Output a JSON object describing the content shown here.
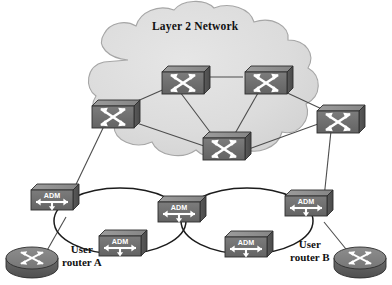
{
  "figure": {
    "title": "Layer 2 Network",
    "background_color": "#ffffff",
    "style": "grayscale-network-diagram"
  },
  "colors": {
    "cloud_fill": "#d9d9d9",
    "cloud_edge": "#9a9a9a",
    "device_top": "#8f8f8f",
    "device_face": "#6e6e6e",
    "device_side": "#555555",
    "device_edge": "#2e2e2e",
    "arrow_white": "#ffffff",
    "link": "#4a4a4a",
    "ring": "#1f1f1f",
    "text": "#111111"
  },
  "cloud": {
    "label": "Layer 2 Network",
    "label_x": 157,
    "label_y": 27
  },
  "switches": [
    {
      "id": "sw-top-left",
      "name": "layer2-switch-top-left",
      "x": 160,
      "y": 68,
      "w": 48,
      "h": 27
    },
    {
      "id": "sw-top-right",
      "name": "layer2-switch-top-right",
      "x": 243,
      "y": 68,
      "w": 48,
      "h": 27
    },
    {
      "id": "sw-left",
      "name": "layer2-switch-left",
      "x": 90,
      "y": 101,
      "w": 48,
      "h": 27
    },
    {
      "id": "sw-right",
      "name": "layer2-switch-right",
      "x": 315,
      "y": 106,
      "w": 48,
      "h": 27
    },
    {
      "id": "sw-bottom",
      "name": "layer2-switch-bottom-center",
      "x": 201,
      "y": 134,
      "w": 48,
      "h": 27
    }
  ],
  "switch_links": [
    {
      "from": "sw-top-left",
      "to": "sw-top-right"
    },
    {
      "from": "sw-left",
      "to": "sw-top-left"
    },
    {
      "from": "sw-left",
      "to": "sw-bottom"
    },
    {
      "from": "sw-top-left",
      "to": "sw-bottom"
    },
    {
      "from": "sw-top-right",
      "to": "sw-bottom"
    },
    {
      "from": "sw-top-right",
      "to": "sw-right"
    },
    {
      "from": "sw-bottom",
      "to": "sw-right"
    }
  ],
  "adms": [
    {
      "id": "adm-left",
      "label": "ADM",
      "name": "adm-node-left",
      "x": 55,
      "y": 195,
      "w": 45,
      "h": 24
    },
    {
      "id": "adm-center",
      "label": "ADM",
      "name": "adm-node-center",
      "x": 181,
      "y": 206,
      "w": 45,
      "h": 24
    },
    {
      "id": "adm-right",
      "label": "ADM",
      "name": "adm-node-right",
      "x": 305,
      "y": 200,
      "w": 45,
      "h": 24
    },
    {
      "id": "adm-lower-left",
      "label": "ADM",
      "name": "adm-node-lower-left",
      "x": 118,
      "y": 240,
      "w": 45,
      "h": 24
    },
    {
      "id": "adm-lower-right",
      "label": "ADM",
      "name": "adm-node-lower-right",
      "x": 245,
      "y": 241,
      "w": 45,
      "h": 24
    }
  ],
  "rings": [
    {
      "id": "ring-left",
      "name": "sonet-ring-left",
      "cx": 120,
      "cy": 222,
      "rx": 64,
      "ry": 33
    },
    {
      "id": "ring-right",
      "name": "sonet-ring-right",
      "cx": 246,
      "cy": 222,
      "rx": 64,
      "ry": 33
    }
  ],
  "routers": [
    {
      "id": "router-a",
      "name": "user-router-a",
      "label": "User\nrouter A",
      "label_line1": "User",
      "label_line2": "router A",
      "x": 30,
      "y": 258,
      "rx": 26,
      "ry": 12
    },
    {
      "id": "router-b",
      "name": "user-router-b",
      "label": "User\nrouter B",
      "label_line1": "User",
      "label_line2": "router B",
      "x": 361,
      "y": 258,
      "rx": 26,
      "ry": 12
    }
  ],
  "labels": {
    "user_router_a_line1": "User",
    "user_router_a_line2": "router A",
    "user_router_b_line1": "User",
    "user_router_b_line2": "router B"
  },
  "access_links": [
    {
      "from": "sw-left",
      "to": "adm-left",
      "name": "link-switch-left-to-adm-left"
    },
    {
      "from": "sw-right",
      "to": "adm-right",
      "name": "link-switch-right-to-adm-right"
    },
    {
      "from": "adm-left",
      "to": "router-a",
      "name": "link-adm-left-to-router-a"
    },
    {
      "from": "adm-right",
      "to": "router-b",
      "name": "link-adm-right-to-router-b"
    }
  ]
}
